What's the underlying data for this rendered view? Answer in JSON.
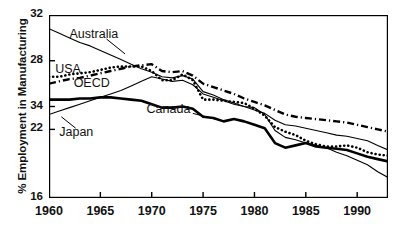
{
  "chart_data": {
    "type": "line",
    "title": "",
    "xlabel": "",
    "ylabel": "% Employment in Manufacturing",
    "xlim": [
      1960,
      1993
    ],
    "ylim": [
      16,
      32
    ],
    "grid": false,
    "legend_position": "inline-annotations",
    "xticks": [
      "1960",
      "1965",
      "1970",
      "1975",
      "1980",
      "1985",
      "1990"
    ],
    "xtick_values": [
      1960,
      1965,
      1970,
      1975,
      1980,
      1985,
      1990
    ],
    "yticks": [
      "32",
      "28",
      "34",
      "22",
      "16"
    ],
    "ytick_values": [
      32,
      28,
      24,
      22,
      16
    ],
    "annotations": [
      {
        "text": "Australia",
        "x": 1962.0,
        "y": 30.2
      },
      {
        "text": "USA",
        "x": 1960.6,
        "y": 27.1
      },
      {
        "text": "OECD",
        "x": 1962.4,
        "y": 25.9
      },
      {
        "text": "Canada",
        "x": 1969.5,
        "y": 23.6
      },
      {
        "text": "Japan",
        "x": 1961.0,
        "y": 21.6
      }
    ],
    "x": [
      1960,
      1961,
      1962,
      1963,
      1964,
      1965,
      1966,
      1967,
      1968,
      1969,
      1970,
      1971,
      1972,
      1973,
      1974,
      1975,
      1976,
      1977,
      1978,
      1979,
      1980,
      1981,
      1982,
      1983,
      1984,
      1985,
      1986,
      1987,
      1988,
      1989,
      1990,
      1991,
      1992,
      1993
    ],
    "series": [
      {
        "name": "Australia",
        "style": "thin-solid",
        "values": [
          30.8,
          30.4,
          30.0,
          29.6,
          29.3,
          28.9,
          28.5,
          28.1,
          27.7,
          27.3,
          27.0,
          26.6,
          26.5,
          26.7,
          26.4,
          25.3,
          25.0,
          24.6,
          24.3,
          24.0,
          23.9,
          23.3,
          21.9,
          21.3,
          21.1,
          20.8,
          20.6,
          20.4,
          20.0,
          19.7,
          19.3,
          18.9,
          18.3,
          17.8
        ]
      },
      {
        "name": "USA",
        "style": "thick-dotted",
        "values": [
          26.6,
          26.6,
          26.8,
          26.9,
          27.0,
          27.2,
          27.4,
          27.5,
          27.5,
          27.5,
          27.1,
          26.3,
          26.3,
          26.8,
          26.3,
          24.6,
          24.6,
          24.5,
          24.4,
          24.3,
          23.8,
          23.2,
          22.2,
          21.8,
          21.5,
          21.0,
          20.7,
          20.5,
          20.5,
          20.6,
          20.4,
          20.0,
          19.8,
          19.7
        ]
      },
      {
        "name": "OECD",
        "style": "dash-dot",
        "values": [
          26.0,
          26.2,
          26.4,
          26.5,
          26.7,
          26.9,
          27.1,
          27.3,
          27.5,
          27.6,
          27.7,
          27.1,
          27.0,
          27.1,
          26.7,
          26.0,
          25.7,
          25.4,
          25.1,
          24.7,
          24.4,
          24.1,
          23.7,
          23.3,
          23.1,
          23.0,
          22.9,
          22.8,
          22.7,
          22.6,
          22.4,
          22.2,
          22.0,
          21.8
        ]
      },
      {
        "name": "Canada",
        "style": "thick-solid",
        "values": [
          24.6,
          24.6,
          24.6,
          24.7,
          24.7,
          24.8,
          24.8,
          24.7,
          24.6,
          24.5,
          24.2,
          23.9,
          23.9,
          24.0,
          23.8,
          23.1,
          23.0,
          22.7,
          22.9,
          22.7,
          22.4,
          22.1,
          20.8,
          20.4,
          20.6,
          20.8,
          20.5,
          20.4,
          20.3,
          20.2,
          19.9,
          19.6,
          19.4,
          19.2
        ]
      },
      {
        "name": "Japan",
        "style": "thin-solid",
        "values": [
          23.3,
          23.6,
          23.9,
          24.2,
          24.5,
          24.8,
          25.1,
          25.4,
          25.8,
          26.2,
          26.6,
          26.4,
          26.2,
          26.3,
          25.9,
          25.1,
          24.8,
          24.5,
          24.2,
          24.0,
          23.7,
          23.4,
          22.8,
          22.4,
          22.3,
          22.1,
          21.9,
          21.7,
          21.5,
          21.4,
          21.2,
          21.0,
          20.6,
          20.2
        ]
      }
    ]
  }
}
